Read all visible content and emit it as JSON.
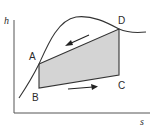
{
  "diagram": {
    "type": "h-s cycle diagram",
    "axes": {
      "y_label": "h",
      "x_label": "s"
    },
    "points": [
      {
        "id": "A",
        "label": "A"
      },
      {
        "id": "B",
        "label": "B"
      },
      {
        "id": "C",
        "label": "C"
      },
      {
        "id": "D",
        "label": "D"
      }
    ],
    "arrows": [
      {
        "name": "upper-arrow",
        "direction": "D to A"
      },
      {
        "name": "lower-arrow",
        "direction": "B to C"
      }
    ],
    "colors": {
      "line": "#333333",
      "fill": "#d4d4d4",
      "background": "#ffffff"
    }
  }
}
